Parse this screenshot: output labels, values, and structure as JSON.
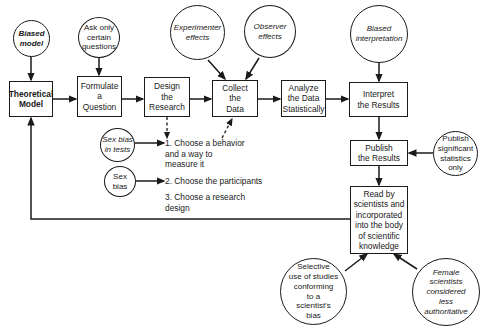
{
  "diagram": {
    "process_boxes": [
      {
        "id": "theoretical-model",
        "label": "Theoretical\nModel"
      },
      {
        "id": "formulate-question",
        "label": "Formulate\na\nQuestion"
      },
      {
        "id": "design-research",
        "label": "Design\nthe\nResearch"
      },
      {
        "id": "collect-data",
        "label": "Collect\nthe\nData"
      },
      {
        "id": "analyze-data",
        "label": "Analyze\nthe Data\nStatistically"
      },
      {
        "id": "interpret-results",
        "label": "Interpret\nthe Results"
      },
      {
        "id": "publish-results",
        "label": "Publish\nthe Results"
      },
      {
        "id": "read-by-scientists",
        "label": "Read by\nscientists and\nincorporated\ninto the body\nof scientific\nknowledge"
      }
    ],
    "bias_circles": [
      {
        "id": "biased-model",
        "label": "Biased\nmodel"
      },
      {
        "id": "ask-only-certain",
        "label": "Ask only\ncertain\nquestions"
      },
      {
        "id": "experimenter-effects",
        "label": "Experimenter\neffects"
      },
      {
        "id": "observer-effects",
        "label": "Observer\neffects"
      },
      {
        "id": "biased-interpretation",
        "label": "Biased\ninterpretation"
      },
      {
        "id": "sex-bias-tests",
        "label": "Sex bias\nin tests"
      },
      {
        "id": "sex-bias",
        "label": "Sex\nbias"
      },
      {
        "id": "publish-significant",
        "label": "Publish\nsignificant\nstatistics\nonly"
      },
      {
        "id": "selective-use",
        "label": "Selective\nuse of studies\nconforming\nto a\nscientist's\nbias"
      },
      {
        "id": "female-scientists",
        "label": "Female\nscientists\nconsidered\nless\nauthoritative"
      }
    ],
    "design_steps": [
      {
        "id": "step-1",
        "label": "1. Choose a behavior\n    and a way to\n    measure it"
      },
      {
        "id": "step-2",
        "label": "2. Choose the participants"
      },
      {
        "id": "step-3",
        "label": "3. Choose a research\n    design"
      }
    ]
  }
}
